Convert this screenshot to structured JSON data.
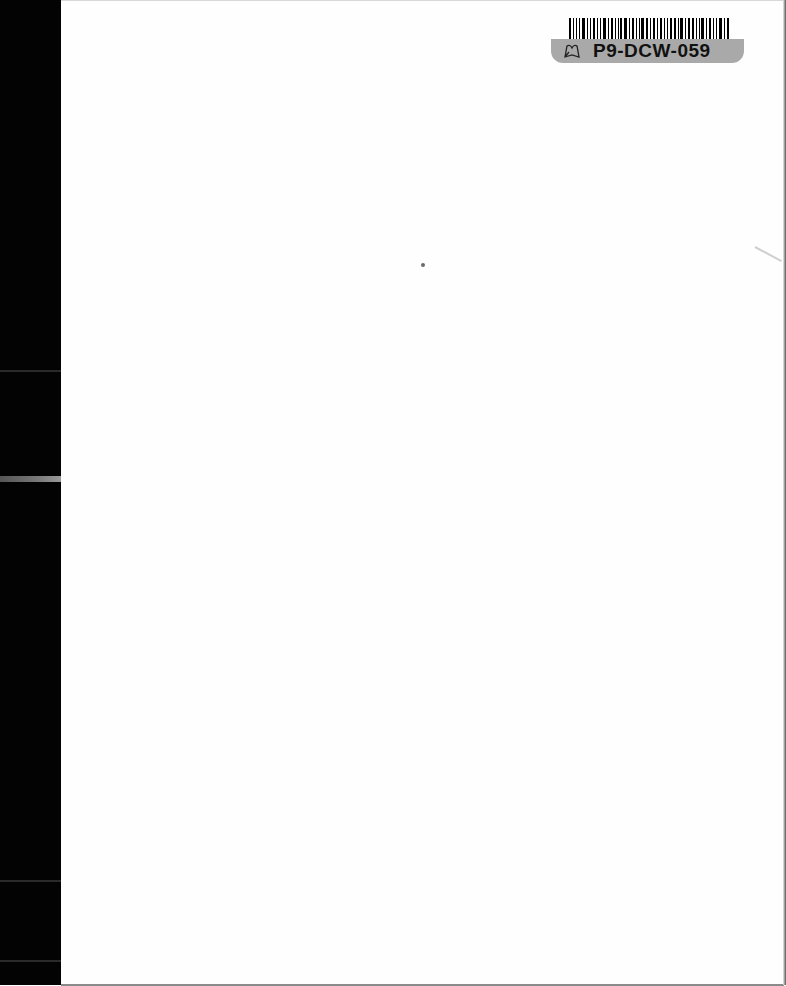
{
  "document": {
    "type": "scanned-blank-page",
    "label": {
      "code": "P9-DCW-059",
      "icon": "book-leaf-icon",
      "barcode_widths": [
        2,
        1,
        2,
        1,
        3,
        1,
        1,
        2,
        2,
        1,
        3,
        1,
        2,
        1,
        1,
        2,
        3,
        1,
        2,
        1,
        1,
        3,
        2,
        1,
        2,
        1,
        3,
        1,
        1,
        2,
        2,
        1,
        3,
        1,
        2,
        2,
        1,
        1,
        3,
        1,
        2,
        1,
        2,
        3,
        1,
        2
      ]
    },
    "colors": {
      "page": "#fefefe",
      "scan_edge": "#030303",
      "label_background": "#a9a9a9",
      "label_text": "#111111"
    }
  }
}
